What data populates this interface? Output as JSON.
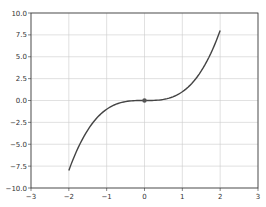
{
  "chart_data": {
    "type": "line",
    "title": "",
    "xlabel": "",
    "ylabel": "",
    "xlim": [
      -3,
      3
    ],
    "ylim": [
      -10,
      10
    ],
    "grid": true,
    "x_ticks": [
      -3,
      -2,
      -1,
      0,
      1,
      2,
      3
    ],
    "y_ticks": [
      -10.0,
      -7.5,
      -5.0,
      -2.5,
      0.0,
      2.5,
      5.0,
      7.5,
      10.0
    ],
    "x_tick_labels": [
      "−3",
      "−2",
      "−1",
      "0",
      "1",
      "2",
      "3"
    ],
    "y_tick_labels": [
      "−10.0",
      "−7.5",
      "−5.0",
      "−2.5",
      "0.0",
      "2.5",
      "5.0",
      "7.5",
      "10.0"
    ],
    "series": [
      {
        "name": "y = x^3",
        "x": [
          -2.0,
          -1.5,
          -1.0,
          -0.5,
          0.0,
          0.5,
          1.0,
          1.5,
          2.0
        ],
        "y": [
          -8.0,
          -3.375,
          -1.0,
          -0.125,
          0.0,
          0.125,
          1.0,
          3.375,
          8.0
        ],
        "color": "#444444"
      }
    ],
    "markers": [
      {
        "x": 0,
        "y": 0,
        "color": "#555555"
      }
    ]
  },
  "colors": {
    "line": "#444444",
    "grid": "#cccccc",
    "axes": "#333333",
    "marker": "#555555"
  }
}
